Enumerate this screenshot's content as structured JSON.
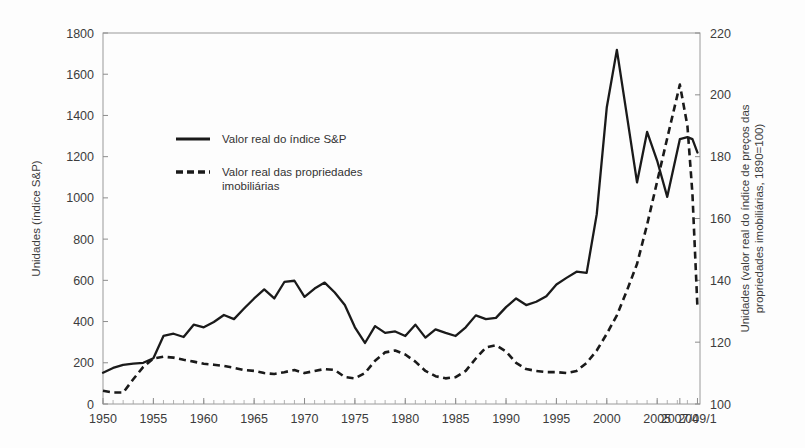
{
  "chart_data": {
    "type": "line",
    "title": "",
    "xlabel": "",
    "ylabel": "Unidades (índice S&P)",
    "y2label": "Unidades (valor real do índice de preços das propriedades imobiliárias, 1890=100)",
    "grid": false,
    "legend_position": "upper-left-inside",
    "xlim": [
      1950,
      2009.25
    ],
    "ylim": [
      0,
      1800
    ],
    "y2lim": [
      100,
      220
    ],
    "yticks": [
      0,
      200,
      400,
      600,
      800,
      1000,
      1200,
      1400,
      1600,
      1800
    ],
    "y2ticks": [
      100,
      120,
      140,
      160,
      180,
      200,
      220
    ],
    "xticks": [
      1950,
      1955,
      1960,
      1965,
      1970,
      1975,
      1980,
      1985,
      1990,
      1995,
      2000,
      2005,
      2007.25,
      2009.0
    ],
    "xticklabels": [
      "1950",
      "1955",
      "1960",
      "1965",
      "1970",
      "1975",
      "1980",
      "1985",
      "1990",
      "1995",
      "2000",
      "2005",
      "2007/4",
      "2009/1"
    ],
    "series": [
      {
        "name": "Valor real do índice S&P",
        "style": "solid",
        "axis": "left",
        "color": "#1a1a1a",
        "x": [
          1950,
          1951,
          1952,
          1953,
          1954,
          1955,
          1956,
          1957,
          1958,
          1959,
          1960,
          1961,
          1962,
          1963,
          1964,
          1965,
          1966,
          1967,
          1968,
          1969,
          1970,
          1971,
          1972,
          1973,
          1974,
          1975,
          1976,
          1977,
          1978,
          1979,
          1980,
          1981,
          1982,
          1983,
          1984,
          1985,
          1986,
          1987,
          1988,
          1989,
          1990,
          1991,
          1992,
          1993,
          1994,
          1995,
          1996,
          1997,
          1998,
          1999,
          2000,
          2001,
          2002,
          2003,
          2004,
          2005,
          2006,
          2007.25,
          2008,
          2008.5,
          2009.0
        ],
        "y": [
          152,
          175,
          190,
          196,
          200,
          222,
          330,
          341,
          325,
          385,
          372,
          398,
          432,
          412,
          463,
          512,
          556,
          512,
          592,
          598,
          520,
          560,
          589,
          541,
          480,
          372,
          296,
          378,
          345,
          352,
          330,
          385,
          322,
          362,
          345,
          330,
          372,
          430,
          412,
          418,
          470,
          512,
          480,
          496,
          523,
          580,
          612,
          642,
          636,
          920,
          1440,
          1718,
          1398,
          1075,
          1320,
          1180,
          1005,
          1285,
          1295,
          1285,
          1220
        ],
        "note": "Real S&P index, left axis"
      },
      {
        "name": "Valor real das propriedades imobiliárias",
        "style": "dashed",
        "axis": "right",
        "color": "#1a1a1a",
        "x": [
          1950,
          1951,
          1952,
          1953,
          1954,
          1955,
          1956,
          1957,
          1958,
          1959,
          1960,
          1961,
          1962,
          1963,
          1964,
          1965,
          1966,
          1967,
          1968,
          1969,
          1970,
          1971,
          1972,
          1973,
          1974,
          1975,
          1976,
          1977,
          1978,
          1979,
          1980,
          1981,
          1982,
          1983,
          1984,
          1985,
          1986,
          1987,
          1988,
          1989,
          1990,
          1991,
          1992,
          1993,
          1994,
          1995,
          1996,
          1997,
          1998,
          1999,
          2000,
          2001,
          2002,
          2003,
          2004,
          2005,
          2006,
          2007.25,
          2008,
          2008.5,
          2009.0
        ],
        "y2": [
          104.3,
          103.7,
          103.7,
          108.0,
          112.0,
          114.7,
          115.3,
          115.0,
          114.3,
          113.7,
          113.0,
          112.7,
          112.3,
          111.7,
          111.0,
          110.7,
          110.0,
          109.7,
          110.3,
          111.0,
          110.0,
          110.7,
          111.3,
          111.0,
          108.7,
          108.3,
          110.0,
          114.0,
          116.7,
          117.3,
          116.0,
          113.7,
          110.7,
          109.0,
          108.3,
          108.7,
          110.7,
          114.7,
          118.3,
          119.0,
          117.0,
          113.3,
          111.3,
          110.7,
          110.3,
          110.3,
          110.0,
          110.7,
          113.3,
          117.3,
          122.7,
          128.7,
          136.7,
          145.3,
          158.0,
          172.0,
          186.0,
          203.3,
          190.0,
          168.0,
          131.0
        ],
        "note": "Real home price index, right axis, 1890=100"
      }
    ],
    "legend": [
      {
        "label": "Valor real do índice S&P",
        "style": "solid"
      },
      {
        "label": "Valor real das propriedades imobiliárias",
        "style": "dashed"
      }
    ]
  },
  "axes": {
    "left_title": "Unidades (índice S&P)",
    "right_title_line1": "Unidades (valor real do índice de preços das",
    "right_title_line2": "propriedades imobiliárias, 1890=100)",
    "left_ticks": [
      "0",
      "200",
      "400",
      "600",
      "800",
      "1000",
      "1200",
      "1400",
      "1600",
      "1800"
    ],
    "right_ticks": [
      "100",
      "120",
      "140",
      "160",
      "180",
      "200",
      "220"
    ],
    "x_ticks": [
      "1950",
      "1955",
      "1960",
      "1965",
      "1970",
      "1975",
      "1980",
      "1985",
      "1990",
      "1995",
      "2000",
      "2005",
      "2007/4",
      "2009/1"
    ]
  },
  "legend": {
    "item1_label": "Valor real do índice S&P",
    "item2_label_line1": "Valor real das propriedades",
    "item2_label_line2": "imobiliárias"
  }
}
